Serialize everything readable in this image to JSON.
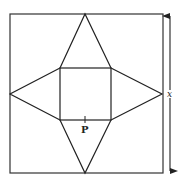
{
  "diagram": {
    "type": "geometry",
    "labels": {
      "point": "P",
      "side": "x"
    },
    "outer_square": {
      "x": 10,
      "y": 14,
      "w": 153,
      "h": 159
    },
    "inner_square": {
      "x": 60,
      "y": 68,
      "w": 51,
      "h": 52
    },
    "triangle_apexes": {
      "top": [
        85,
        14
      ],
      "bottom": [
        85,
        173
      ],
      "left": [
        10,
        94
      ],
      "right": [
        162,
        94
      ]
    },
    "dimension_arrow": {
      "x": 170,
      "y1": 14,
      "y2": 173,
      "label": "x"
    },
    "stroke_color": "#222222"
  }
}
